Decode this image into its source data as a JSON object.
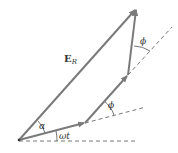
{
  "diagram": {
    "colors": {
      "phasor": "#7a7a7a",
      "dashed": "#555555",
      "text": "#333333",
      "background": "#ffffff"
    },
    "points": {
      "origin": [
        19,
        140
      ],
      "p1": [
        85,
        123
      ],
      "p2": [
        128,
        75
      ],
      "resultant_tip": [
        137,
        8
      ]
    },
    "labels": {
      "resultant_main": "E",
      "resultant_sub": "R",
      "alpha": "α",
      "omega_t": "ωt",
      "phi_1": "ϕ",
      "phi_2": "ϕ"
    }
  }
}
